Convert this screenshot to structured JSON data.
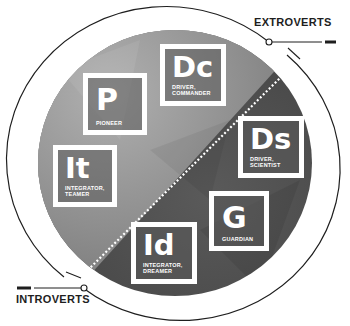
{
  "labels": {
    "extroverts": "EXTROVERTS",
    "introverts": "INTROVERTS"
  },
  "types": [
    {
      "code": "P",
      "line1": "PIONEER",
      "line2": ""
    },
    {
      "code": "Dc",
      "line1": "DRIVER,",
      "line2": "COMMANDER"
    },
    {
      "code": "Ds",
      "line1": "DRIVER,",
      "line2": "SCIENTIST"
    },
    {
      "code": "It",
      "line1": "INTEGRATOR,",
      "line2": "TEAMER"
    },
    {
      "code": "G",
      "line1": "GUARDIAN",
      "line2": ""
    },
    {
      "code": "Id",
      "line1": "INTEGRATOR,",
      "line2": "DREAMER"
    }
  ],
  "colors": {
    "ink": "#1e1e1e",
    "upper_fill": "#8a8a8a",
    "lower_fill": "#4a4a4a",
    "box_border": "#ffffff"
  }
}
